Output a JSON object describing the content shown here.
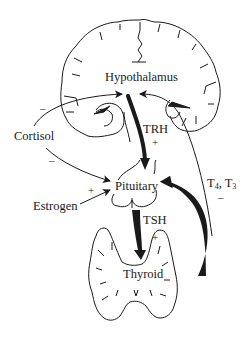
{
  "diagram": {
    "type": "hormonal-feedback-loop",
    "nodes": {
      "hypothalamus": "Hypothalamus",
      "pituitary": "Pituitary",
      "thyroid": "Thyroid",
      "cortisol": "Cortisol",
      "estrogen": "Estrogen"
    },
    "hormones": {
      "trh": "TRH",
      "tsh": "TSH",
      "t4": "T",
      "t4_sub": "4",
      "sep": ", ",
      "t3": "T",
      "t3_sub": "3"
    },
    "signs": {
      "cortisol_to_hypothalamus": "–",
      "cortisol_to_pituitary": "–",
      "estrogen_to_pituitary": "+",
      "trh_effect": "+",
      "tsh_effect": "+",
      "t4t3_effect": "–"
    },
    "edges": [
      {
        "from": "Hypothalamus",
        "to": "Pituitary",
        "label": "TRH",
        "sign": "+"
      },
      {
        "from": "Pituitary",
        "to": "Thyroid",
        "label": "TSH",
        "sign": "+"
      },
      {
        "from": "Thyroid",
        "to": "Pituitary",
        "label": "T4, T3",
        "sign": "-"
      },
      {
        "from": "Thyroid",
        "to": "Hypothalamus",
        "label": "T4, T3",
        "sign": "-"
      },
      {
        "from": "Cortisol",
        "to": "Hypothalamus",
        "sign": "-"
      },
      {
        "from": "Cortisol",
        "to": "Pituitary",
        "sign": "-"
      },
      {
        "from": "Estrogen",
        "to": "Pituitary",
        "sign": "+"
      }
    ],
    "colors": {
      "ink": "#1a1a1a",
      "background": "#ffffff"
    }
  }
}
